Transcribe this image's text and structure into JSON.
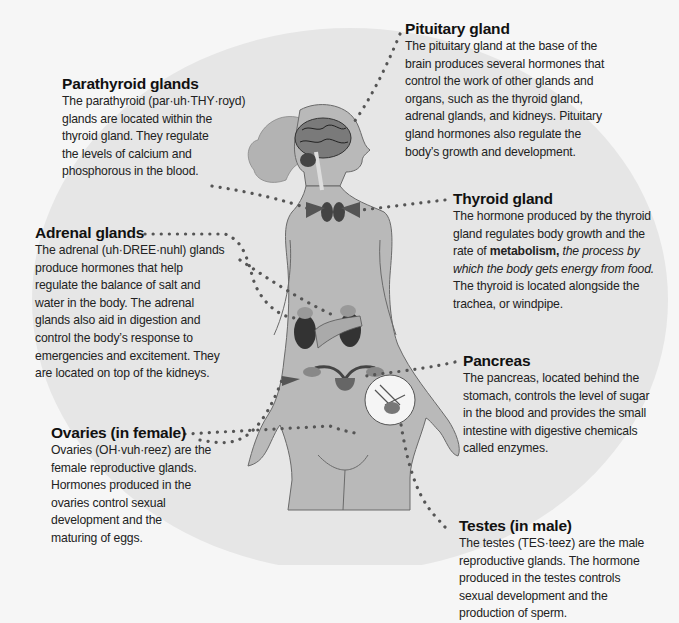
{
  "figure": {
    "colors": {
      "page_background": "#f6f6f6",
      "circle_background": "#e6e6e6",
      "body_fill": "#b9b9b9",
      "body_outline": "#6a6a6a",
      "organ_dark": "#3c3c3c",
      "leader_dots": "#555555",
      "text": "#1c1c1c"
    }
  },
  "labels": {
    "pituitary": {
      "title": "Pituitary gland",
      "lines": [
        "The pituitary gland at the base of the",
        "brain produces several hormones that",
        "control the work of other glands and",
        "organs, such as the thyroid gland,",
        "adrenal glands, and kidneys. Pituitary",
        "gland hormones also regulate the",
        "body’s growth and development."
      ]
    },
    "parathyroid": {
      "title": "Parathyroid glands",
      "lines": [
        "The parathyroid (par·uh·THY·royd)",
        "glands are located within the",
        "thyroid gland. They regulate",
        "the levels of calcium and",
        "phosphorous in the blood."
      ]
    },
    "thyroid": {
      "title": "Thyroid gland",
      "lines": [
        "The hormone produced by the thyroid",
        "gland regulates body growth and the"
      ],
      "line3_prefix": "rate of ",
      "line3_bold": "metabolism,",
      "line3_italic": " the process by",
      "line4_italic": "which the body gets energy from food.",
      "lines_after": [
        "The thyroid is located alongside the",
        "trachea, or windpipe."
      ]
    },
    "adrenal": {
      "title": "Adrenal glands",
      "lines": [
        "The adrenal (uh·DREE·nuhl) glands",
        "produce hormones that help",
        "regulate the balance of salt and",
        "water in the body. The adrenal",
        "glands also aid in digestion and",
        "control the body’s response to",
        "emergencies and excitement. They",
        "are located on top of the kidneys."
      ]
    },
    "pancreas": {
      "title": "Pancreas",
      "lines": [
        "The pancreas, located behind the",
        "stomach, controls the level of sugar",
        "in the blood and provides the small",
        "intestine with digestive chemicals",
        "called enzymes."
      ]
    },
    "ovaries": {
      "title": "Ovaries (in female)",
      "lines": [
        "Ovaries (OH·vuh·reez) are the",
        "female reproductive glands.",
        "Hormones produced in the",
        "ovaries control sexual",
        "development and the",
        "maturing of eggs."
      ]
    },
    "testes": {
      "title": "Testes (in male)",
      "lines": [
        "The testes (TES·teez) are the male",
        "reproductive glands. The hormone",
        "produced in the testes controls",
        "sexual development and the",
        "production of sperm."
      ]
    }
  }
}
